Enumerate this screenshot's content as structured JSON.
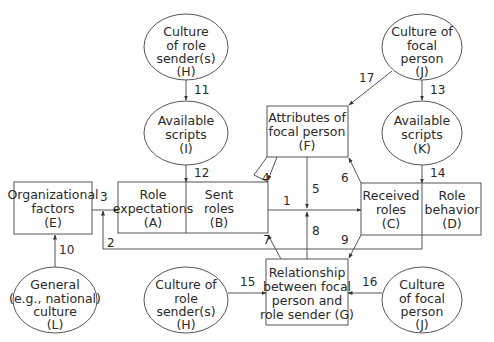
{
  "diagram": {
    "type": "flow-diagram",
    "title": "",
    "colors": {
      "stroke": "#555555",
      "text": "#2a2a2a",
      "background": "#ffffff"
    },
    "nodes": {
      "H_top": {
        "shape": "ellipse",
        "lines": [
          "Culture",
          "of role",
          "sender(s)",
          "(H)"
        ]
      },
      "I": {
        "shape": "ellipse",
        "lines": [
          "Available",
          "scripts",
          "(I)"
        ]
      },
      "J_top": {
        "shape": "ellipse",
        "lines": [
          "Culture of",
          "focal",
          "person",
          "(J)"
        ]
      },
      "K": {
        "shape": "ellipse",
        "lines": [
          "Available",
          "scripts",
          "(K)"
        ]
      },
      "F": {
        "shape": "box",
        "lines": [
          "Attributes of",
          "focal person",
          "(F)"
        ]
      },
      "E": {
        "shape": "box",
        "lines": [
          "Organizational",
          "factors",
          "(E)"
        ]
      },
      "A": {
        "shape": "box",
        "lines": [
          "Role",
          "expectations",
          "(A)"
        ]
      },
      "B": {
        "shape": "box",
        "lines": [
          "Sent",
          "roles",
          "(B)"
        ]
      },
      "C": {
        "shape": "box",
        "lines": [
          "Received",
          "roles",
          "(C)"
        ]
      },
      "D": {
        "shape": "box",
        "lines": [
          "Role",
          "behavior",
          "(D)"
        ]
      },
      "G": {
        "shape": "box",
        "lines": [
          "Relationship",
          "between focal",
          "person and",
          "role sender (G)"
        ]
      },
      "L": {
        "shape": "ellipse",
        "lines": [
          "General",
          "(e.g., national)",
          "culture",
          "(L)"
        ]
      },
      "H_bottom": {
        "shape": "ellipse",
        "lines": [
          "Culture of",
          "role",
          "sender(s)",
          "(H)"
        ]
      },
      "J_bottom": {
        "shape": "ellipse",
        "lines": [
          "Culture",
          "of focal",
          "person",
          "(J)"
        ]
      }
    },
    "edges": [
      {
        "label": "1",
        "from": "B",
        "to": "C"
      },
      {
        "label": "2",
        "from": "C",
        "to": "A"
      },
      {
        "label": "3",
        "from": "E",
        "to": "A"
      },
      {
        "label": "4",
        "from": "F",
        "to": "B"
      },
      {
        "label": "5",
        "from": "F",
        "to": "edge-1"
      },
      {
        "label": "6",
        "from": "C",
        "to": "F"
      },
      {
        "label": "7",
        "from": "G",
        "to": "B"
      },
      {
        "label": "8",
        "from": "G",
        "to": "edge-1"
      },
      {
        "label": "9",
        "from": "C",
        "to": "G"
      },
      {
        "label": "10",
        "from": "L",
        "to": "E"
      },
      {
        "label": "11",
        "from": "H_top",
        "to": "I"
      },
      {
        "label": "12",
        "from": "I",
        "to": "A"
      },
      {
        "label": "13",
        "from": "J_top",
        "to": "K"
      },
      {
        "label": "14",
        "from": "K",
        "to": "C"
      },
      {
        "label": "15",
        "from": "H_bottom",
        "to": "G"
      },
      {
        "label": "16",
        "from": "J_bottom",
        "to": "G"
      },
      {
        "label": "17",
        "from": "J_top",
        "to": "F"
      }
    ]
  }
}
